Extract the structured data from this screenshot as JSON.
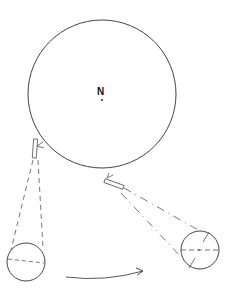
{
  "diagram": {
    "center_label": "N",
    "colors": {
      "stroke": "#444444",
      "text": "#111111",
      "background": "#ffffff"
    },
    "main_circle": {
      "cx": 102,
      "cy": 94,
      "r": 74
    },
    "left_view": {
      "circle": {
        "cx": 26,
        "cy": 262,
        "r": 19
      }
    },
    "right_view": {
      "circle": {
        "cx": 200,
        "cy": 250,
        "r": 19
      }
    },
    "arrow": {
      "direction": "left-to-right"
    }
  }
}
